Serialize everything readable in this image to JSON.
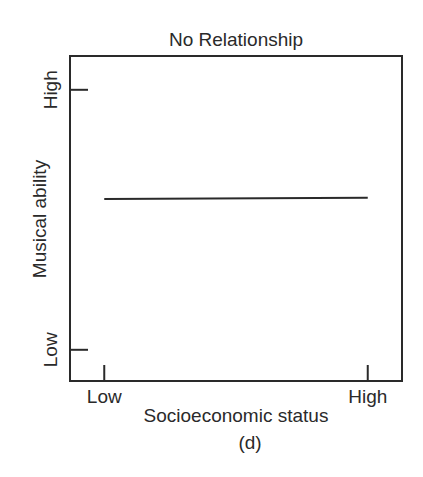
{
  "chart_data": {
    "type": "line",
    "title": "No Relationship",
    "xlabel": "Socioeconomic status",
    "ylabel": "Musical ability",
    "caption": "(d)",
    "x_ticks": [
      {
        "label": "Low",
        "value": 0
      },
      {
        "label": "High",
        "value": 1
      }
    ],
    "y_ticks": [
      {
        "label": "Low",
        "value": 0
      },
      {
        "label": "High",
        "value": 1
      }
    ],
    "xlim": [
      -0.13,
      1.13
    ],
    "ylim": [
      -0.12,
      1.13
    ],
    "grid": false,
    "series": [
      {
        "name": "relationship",
        "x": [
          0,
          1
        ],
        "y": [
          0.58,
          0.585
        ]
      }
    ],
    "colors": {
      "ink": "#2a2a2a"
    }
  }
}
